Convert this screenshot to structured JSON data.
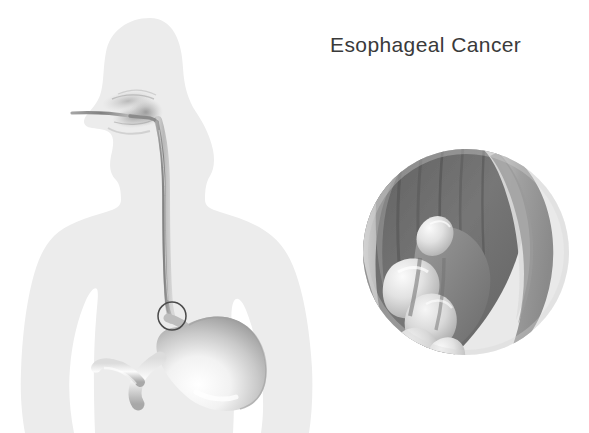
{
  "figure": {
    "title": "Esophageal Cancer",
    "title_color": "#3a3a3a",
    "background_color": "#ffffff"
  },
  "illustration": {
    "type": "medical-anatomical-diagram",
    "body_silhouette": {
      "name": "human-upper-body-profile",
      "orientation": "facing-left",
      "fill_color": "#ececec"
    },
    "endoscope": {
      "name": "endoscope-tube",
      "entry": "mouth",
      "path": "mouth-to-pharynx-to-esophagus-to-gastroesophageal-junction",
      "color": "#9a9a9a"
    },
    "esophagus": {
      "name": "esophagus",
      "color": "#bdbdbd"
    },
    "stomach": {
      "name": "stomach",
      "parts": [
        "fundus",
        "body",
        "antrum",
        "pylorus",
        "duodenum"
      ],
      "fill_light": "#fdfdfd",
      "fill_shadow": "#9a9a9a"
    },
    "lesion_marker": {
      "name": "lesion-location-circle",
      "shape": "circle",
      "location": "gastroesophageal-junction",
      "center_x": 172,
      "center_y": 316,
      "radius": 14,
      "stroke_color": "#4a4a4a"
    },
    "inset": {
      "name": "magnified-tumor-inset",
      "shape": "circle",
      "center_x": 466,
      "center_y": 252,
      "radius": 103,
      "rim_color": "#e2e2e2",
      "lumen_color": "#6e6e6e",
      "wall_color": "#b4b4b4",
      "tumor_color": "#e8e8e8",
      "description": "cross-section of esophageal wall with lobulated tumor mass protruding into lumen"
    }
  }
}
